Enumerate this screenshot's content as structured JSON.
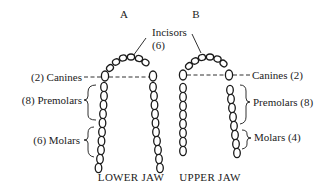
{
  "diagram": {
    "panel_a": {
      "letter": "A",
      "caption": "LOWER JAW",
      "labels": {
        "incisors": "Incisors",
        "incisors_count": "(6)",
        "canines": "(2) Canines",
        "premolars": "(8) Premolars",
        "molars": "(6) Molars"
      }
    },
    "panel_b": {
      "letter": "B",
      "caption": "UPPER JAW",
      "labels": {
        "canines": "Canines (2)",
        "premolars": "Premolars (8)",
        "molars": "Molars (4)"
      }
    },
    "colors": {
      "ink": "#1a1a1a",
      "background": "#ffffff"
    }
  }
}
